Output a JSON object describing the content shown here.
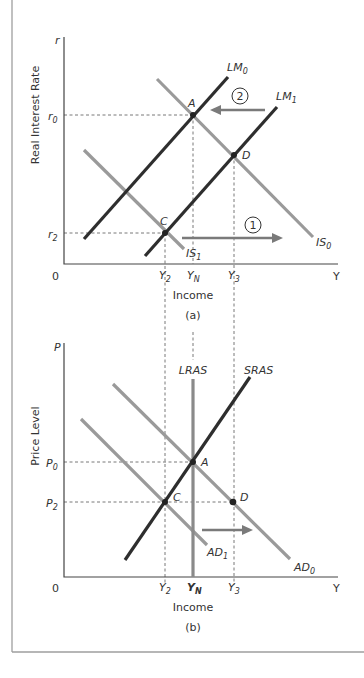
{
  "colors": {
    "dark_curve": "#2e2e2e",
    "light_curve": "#9a9a9a",
    "arrow": "#7a7a7a",
    "frame": "#9e9e9e",
    "text": "#333333"
  },
  "panel_a": {
    "caption": "(a)",
    "y_axis_label": "Real Interest Rate",
    "y_axis_var": "r",
    "x_axis_label": "Income",
    "x_axis_var": "Y",
    "origin": "0",
    "ticks_y": [
      {
        "base": "r",
        "sub": "0"
      },
      {
        "base": "r",
        "sub": "2"
      }
    ],
    "ticks_x": [
      {
        "base": "Y",
        "sub": "2"
      },
      {
        "base": "Y",
        "sub": "N"
      },
      {
        "base": "Y",
        "sub": "3"
      }
    ],
    "curves": [
      {
        "base": "LM",
        "sub": "0"
      },
      {
        "base": "LM",
        "sub": "1"
      },
      {
        "base": "IS",
        "sub": "0"
      },
      {
        "base": "IS",
        "sub": "1"
      }
    ],
    "points": [
      "A",
      "C",
      "D"
    ],
    "step_markers": [
      "1",
      "2"
    ]
  },
  "panel_b": {
    "caption": "(b)",
    "y_axis_label": "Price Level",
    "y_axis_var": "P",
    "x_axis_label": "Income",
    "x_axis_var": "Y",
    "origin": "0",
    "ticks_y": [
      {
        "base": "P",
        "sub": "0"
      },
      {
        "base": "P",
        "sub": "2"
      }
    ],
    "ticks_x": [
      {
        "base": "Y",
        "sub": "2"
      },
      {
        "base": "Y",
        "sub": "N"
      },
      {
        "base": "Y",
        "sub": "3"
      }
    ],
    "curves": [
      {
        "base": "LRAS",
        "sub": ""
      },
      {
        "base": "SRAS",
        "sub": ""
      },
      {
        "base": "AD",
        "sub": "0"
      },
      {
        "base": "AD",
        "sub": "1"
      }
    ],
    "points": [
      "A",
      "C",
      "D"
    ]
  }
}
